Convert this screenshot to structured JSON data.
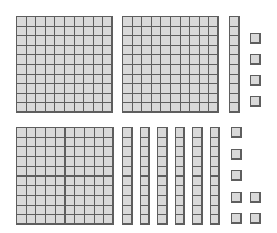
{
  "diagram": {
    "title": "Base-ten blocks",
    "style": {
      "fill_color": "#d9d9d9",
      "line_color": "#5e5e5e",
      "background": "#ffffff"
    },
    "rows": [
      {
        "name": "top-row",
        "hundreds": 2,
        "tens": 1,
        "ones": 4,
        "value": 214
      },
      {
        "name": "bottom-row",
        "hundreds": 1,
        "tens": 6,
        "ones": 7,
        "value": 167
      }
    ],
    "blocks": [
      {
        "type": "hundred",
        "row": "top",
        "x": 16,
        "y": 16,
        "cols": 10,
        "rows": 10,
        "cell": 9.6
      },
      {
        "type": "hundred",
        "row": "top",
        "x": 122,
        "y": 16,
        "cols": 10,
        "rows": 10,
        "cell": 9.6
      },
      {
        "type": "ten",
        "row": "top",
        "x": 229,
        "y": 16,
        "cols": 1,
        "rows": 10,
        "cell": 9.6
      },
      {
        "type": "one",
        "row": "top",
        "x": 250,
        "y": 33,
        "cols": 1,
        "rows": 1,
        "cell": 10
      },
      {
        "type": "one",
        "row": "top",
        "x": 250,
        "y": 54,
        "cols": 1,
        "rows": 1,
        "cell": 10
      },
      {
        "type": "one",
        "row": "top",
        "x": 250,
        "y": 75,
        "cols": 1,
        "rows": 1,
        "cell": 10
      },
      {
        "type": "one",
        "row": "top",
        "x": 250,
        "y": 96,
        "cols": 1,
        "rows": 1,
        "cell": 10
      },
      {
        "type": "hundred",
        "row": "bottom",
        "x": 16,
        "y": 127,
        "cols": 10,
        "rows": 10,
        "cell": 9.7
      },
      {
        "type": "ten",
        "row": "bottom",
        "x": 122,
        "y": 127,
        "cols": 1,
        "rows": 10,
        "cell": 9.7
      },
      {
        "type": "ten",
        "row": "bottom",
        "x": 139.5,
        "y": 127,
        "cols": 1,
        "rows": 10,
        "cell": 9.7
      },
      {
        "type": "ten",
        "row": "bottom",
        "x": 157,
        "y": 127,
        "cols": 1,
        "rows": 10,
        "cell": 9.7
      },
      {
        "type": "ten",
        "row": "bottom",
        "x": 174.5,
        "y": 127,
        "cols": 1,
        "rows": 10,
        "cell": 9.7
      },
      {
        "type": "ten",
        "row": "bottom",
        "x": 192,
        "y": 127,
        "cols": 1,
        "rows": 10,
        "cell": 9.7
      },
      {
        "type": "ten",
        "row": "bottom",
        "x": 209.5,
        "y": 127,
        "cols": 1,
        "rows": 10,
        "cell": 9.7
      },
      {
        "type": "one",
        "row": "bottom",
        "x": 231,
        "y": 127,
        "cols": 1,
        "rows": 1,
        "cell": 10
      },
      {
        "type": "one",
        "row": "bottom",
        "x": 231,
        "y": 148.5,
        "cols": 1,
        "rows": 1,
        "cell": 10
      },
      {
        "type": "one",
        "row": "bottom",
        "x": 231,
        "y": 170,
        "cols": 1,
        "rows": 1,
        "cell": 10
      },
      {
        "type": "one",
        "row": "bottom",
        "x": 231,
        "y": 192,
        "cols": 1,
        "rows": 1,
        "cell": 10
      },
      {
        "type": "one",
        "row": "bottom",
        "x": 231,
        "y": 213,
        "cols": 1,
        "rows": 1,
        "cell": 10
      },
      {
        "type": "one",
        "row": "bottom",
        "x": 250,
        "y": 192,
        "cols": 1,
        "rows": 1,
        "cell": 10
      },
      {
        "type": "one",
        "row": "bottom",
        "x": 250,
        "y": 213,
        "cols": 1,
        "rows": 1,
        "cell": 10
      }
    ]
  }
}
